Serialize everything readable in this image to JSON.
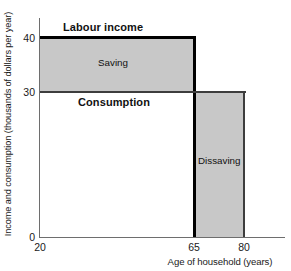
{
  "chart_data": {
    "type": "area",
    "title": "",
    "subtitle": "",
    "xlabel": "Age of household (years)",
    "ylabel": "Income and consumption (thousands of dollars per year)",
    "xlim": [
      20,
      85
    ],
    "ylim": [
      0,
      44
    ],
    "grid": false,
    "legend": "none",
    "x_ticks": [
      "20",
      "65",
      "80"
    ],
    "x_tick_values": [
      20,
      65,
      80
    ],
    "y_ticks": [
      "0",
      "30",
      "40"
    ],
    "y_tick_values": [
      0,
      30,
      40
    ],
    "series": [
      {
        "name": "Labour income",
        "type": "step",
        "x": [
          20,
          65,
          65,
          80
        ],
        "values": [
          40,
          40,
          0,
          0
        ]
      },
      {
        "name": "Consumption",
        "type": "step",
        "x": [
          20,
          65,
          80
        ],
        "values": [
          30,
          30,
          30
        ]
      }
    ],
    "regions": [
      {
        "name": "Saving",
        "x_range": [
          20,
          65
        ],
        "y_range": [
          30,
          40
        ],
        "fill": "#c8c8c8"
      },
      {
        "name": "Dissaving",
        "x_range": [
          65,
          80
        ],
        "y_range": [
          0,
          30
        ],
        "fill": "#c8c8c8"
      }
    ],
    "annotations": [
      {
        "text": "Labour income",
        "bold": true,
        "x": 28,
        "y": 42
      },
      {
        "text": "Saving",
        "bold": false,
        "x": 42,
        "y": 35
      },
      {
        "text": "Consumption",
        "bold": true,
        "x": 33,
        "y": 28
      },
      {
        "text": "Dissaving",
        "bold": false,
        "x": 72,
        "y": 15
      }
    ],
    "colors": {
      "fill": "#c8c8c8",
      "income_line": "#000000",
      "consumption_line": "#3d3d3d",
      "axis": "#6e6e6e",
      "text": "#1a1a1a",
      "background": "#ffffff"
    }
  },
  "axes": {
    "y_title": "Income and consumption (thousands of dollars per year)",
    "x_title": "Age of household (years)",
    "y_tick_40": "40",
    "y_tick_30": "30",
    "y_tick_0": "0",
    "x_tick_20": "20",
    "x_tick_65": "65",
    "x_tick_80": "80"
  },
  "labels": {
    "labour_income": "Labour income",
    "saving": "Saving",
    "consumption": "Consumption",
    "dissaving": "Dissaving"
  }
}
